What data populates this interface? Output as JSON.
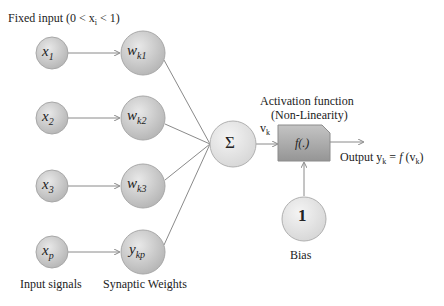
{
  "title": "Fixed input (0 < x",
  "title_sub": "i",
  "title_end": " < 1)",
  "inputs": [
    {
      "main": "x",
      "sub": "1"
    },
    {
      "main": "x",
      "sub": "2"
    },
    {
      "main": "x",
      "sub": "3"
    },
    {
      "main": "x",
      "sub": "p"
    }
  ],
  "weights": [
    {
      "main": "w",
      "sub": "k1"
    },
    {
      "main": "w",
      "sub": "k2"
    },
    {
      "main": "w",
      "sub": "k3"
    },
    {
      "main": "y",
      "sub": "kp"
    }
  ],
  "summation": {
    "symbol": "Σ"
  },
  "vk": {
    "main": "v",
    "sub": "k"
  },
  "activation": {
    "label_line1": "Activation function",
    "label_line2": "(Non-Linearity)",
    "symbol": "f(.)"
  },
  "output": {
    "prefix": "Output y",
    "sub": "k",
    "eq": " = ",
    "f": "f",
    "arg_open": " (v",
    "arg_sub": "k",
    "arg_close": ")"
  },
  "bias": {
    "value": "1",
    "label": "Bias"
  },
  "labels": {
    "input_signals": "Input signals",
    "synaptic_weights": "Synaptic Weights"
  },
  "colors": {
    "node_fill_dark": "#bdbdbd",
    "node_fill_light": "#e6e6e6",
    "box_fill": "#a9a9a9",
    "line": "#8a8a8a"
  }
}
